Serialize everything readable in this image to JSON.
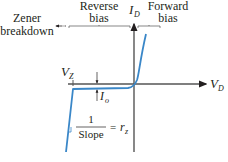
{
  "diagram": {
    "labels": {
      "zener_line1": "Zener",
      "zener_line2": "breakdown",
      "reverse_line1": "Reverse",
      "reverse_line2": "bias",
      "forward_line1": "Forward",
      "forward_line2": "bias",
      "id_main": "I",
      "id_sub": "D",
      "vd_main": "V",
      "vd_sub": "D",
      "vz_main": "V",
      "vz_sub": "Z",
      "io_main": "I",
      "io_sub": "o",
      "fraction_num": "1",
      "fraction_den": "Slope",
      "equals": "= ",
      "rz_main": "r",
      "rz_sub": "z"
    },
    "colors": {
      "curve": "#3a87c8",
      "axis": "#555555",
      "text": "#231f20"
    }
  }
}
